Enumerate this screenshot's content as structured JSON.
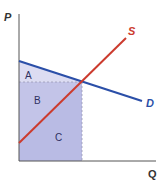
{
  "diagram": {
    "type": "supply-demand",
    "axes": {
      "y_label": "P",
      "x_label": "Q"
    },
    "curves": [
      {
        "name": "S",
        "label": "S",
        "color": "#cc3b2e"
      },
      {
        "name": "D",
        "label": "D",
        "color": "#2b4fa8"
      }
    ],
    "regions": [
      {
        "label": "A",
        "fill": "#dcdcf2"
      },
      {
        "label": "B",
        "fill": "#c3c4e8"
      },
      {
        "label": "C",
        "fill": "#b9bbe4"
      }
    ],
    "colors": {
      "axis": "#555555",
      "dashed": "#9a9ab5",
      "text_region": "#2e3060"
    }
  }
}
